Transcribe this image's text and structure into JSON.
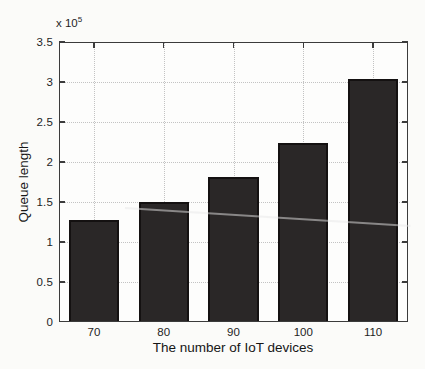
{
  "figure": {
    "type": "scanned-matlab-figure",
    "background_color": "#fbfbf9"
  },
  "chart_data": {
    "type": "bar",
    "title": "",
    "categories": [
      "70",
      "80",
      "90",
      "100",
      "110"
    ],
    "values": [
      127000,
      150000,
      181000,
      224000,
      304000
    ],
    "xlabel": "The number of IoT devices",
    "ylabel": "Queue length",
    "ylim": [
      0,
      350000
    ],
    "ytick_values": [
      0,
      50000,
      100000,
      150000,
      200000,
      250000,
      300000,
      350000
    ],
    "ytick_labels": [
      "0",
      "0.5",
      "1",
      "1.5",
      "2",
      "2.5",
      "3",
      "3.5"
    ],
    "y_multiplier_base": "x 10",
    "y_multiplier_exp": "5",
    "grid": true,
    "grid_style": "dotted",
    "legend_position": "none",
    "bar_fill_color": "#2a2727",
    "bar_edge_color": "#141111",
    "axis_color": "#3b3b3b",
    "grid_color": "#c3c3c3"
  }
}
